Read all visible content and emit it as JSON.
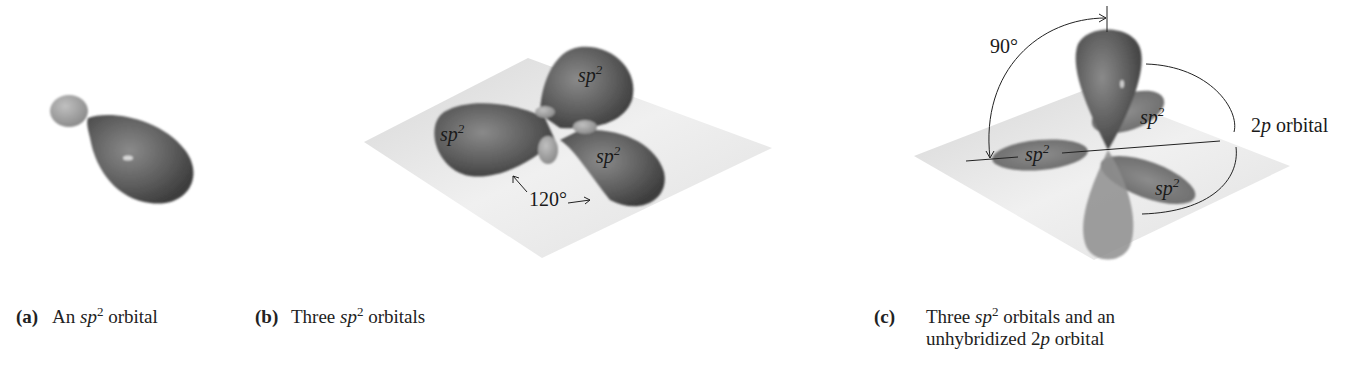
{
  "figure": {
    "panels": [
      {
        "id": "a",
        "tag": "(a)",
        "caption_pre": "An ",
        "caption_sp": "sp",
        "caption_sup": "2",
        "caption_post": " orbital",
        "labels": []
      },
      {
        "id": "b",
        "tag": "(b)",
        "caption_pre": "Three ",
        "caption_sp": "sp",
        "caption_sup": "2",
        "caption_post": " orbitals",
        "labels": {
          "lobe_top": "sp",
          "lobe_left": "sp",
          "lobe_right": "sp",
          "sup": "2",
          "angle": "120°"
        }
      },
      {
        "id": "c",
        "tag": "(c)",
        "caption_pre": "Three ",
        "caption_sp": "sp",
        "caption_sup": "2",
        "caption_post": " orbitals and an",
        "caption_line2_pre": "unhybridized 2",
        "caption_line2_p": "p",
        "caption_line2_post": " orbital",
        "labels": {
          "angle": "90°",
          "p_label_num": "2",
          "p_label_p": "p",
          "p_label_post": " orbital",
          "lobe_back": "sp",
          "lobe_left": "sp",
          "lobe_front": "sp",
          "sup": "2"
        }
      }
    ],
    "colors": {
      "lobe_dark": "#5a5a5a",
      "lobe_mid": "#7a7a7a",
      "small_lobe": "#9a9a9a",
      "plane": "#e4e4e4",
      "text": "#1a1a1a"
    }
  }
}
